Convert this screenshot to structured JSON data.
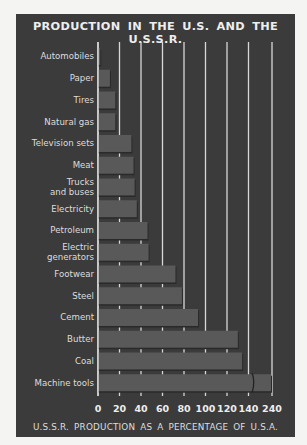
{
  "chart_data": {
    "type": "bar",
    "orientation": "horizontal",
    "title": "PRODUCTION IN THE U.S. AND THE U.S.S.R.",
    "xlabel": "U.S.S.R. PRODUCTION AS A PERCENTAGE OF U.S.A.",
    "ylabel": "",
    "categories": [
      "Automobiles",
      "Paper",
      "Tires",
      "Natural gas",
      "Television sets",
      "Meat",
      "Trucks\nand buses",
      "Electricity",
      "Petroleum",
      "Electric\ngenerators",
      "Footwear",
      "Steel",
      "Cement",
      "Butter",
      "Coal",
      "Machine tools"
    ],
    "values": [
      3,
      12,
      17,
      17,
      32,
      34,
      35,
      37,
      47,
      48,
      73,
      79,
      94,
      131,
      135,
      240
    ],
    "xticks": [
      "0",
      "20",
      "40",
      "60",
      "80",
      "100",
      "120",
      "140",
      "240"
    ],
    "xtick_values": [
      0,
      20,
      40,
      60,
      80,
      100,
      120,
      140,
      240
    ],
    "axis_break": {
      "from": 140,
      "to": 240
    },
    "xlim": [
      0,
      240
    ],
    "grid": true,
    "legend": "none"
  },
  "colors": {
    "background": "#3b3b3b",
    "bar": "#595959",
    "grid": "#d8d8d8",
    "text": "#eeeeee"
  }
}
